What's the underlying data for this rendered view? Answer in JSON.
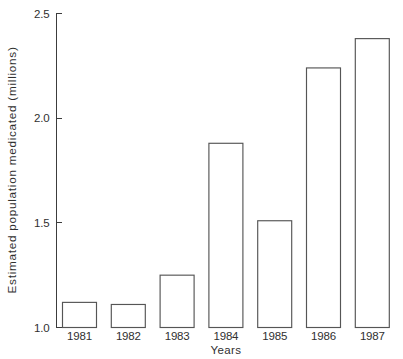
{
  "chart_data": {
    "type": "bar",
    "title": "",
    "xlabel": "Years",
    "ylabel": "Estimated population medicated (millions)",
    "categories": [
      "1981",
      "1982",
      "1983",
      "1984",
      "1985",
      "1986",
      "1987"
    ],
    "values": [
      1.12,
      1.11,
      1.25,
      1.88,
      1.51,
      2.24,
      2.38
    ],
    "series": [
      {
        "name": "Estimated population medicated (millions)",
        "values": [
          1.12,
          1.11,
          1.25,
          1.88,
          1.51,
          2.24,
          2.38
        ]
      }
    ],
    "ylim": [
      1.0,
      2.5
    ],
    "yticks": [
      1.0,
      1.5,
      2.0,
      2.5
    ],
    "ytick_labels": [
      "1.0",
      "1.5",
      "2.0",
      "2.5"
    ],
    "xtick_labels": [
      "1981",
      "1982",
      "1983",
      "1984",
      "1985",
      "1986",
      "1987"
    ],
    "grid": false,
    "legend": false,
    "legend_position": "none",
    "bar_fill": "#ffffff",
    "bar_stroke": "#555555",
    "axis_color": "#3c3c3c",
    "background": "#ffffff"
  },
  "axes": {
    "y_title": "Estimated population medicated (millions)",
    "x_title": "Years"
  },
  "ticks": {
    "y": [
      {
        "label": "2.5",
        "value": 2.5
      },
      {
        "label": "2.0",
        "value": 2.0
      },
      {
        "label": "1.5",
        "value": 1.5
      },
      {
        "label": "1.0",
        "value": 1.0
      }
    ],
    "x": [
      {
        "label": "1981",
        "value": 1.12
      },
      {
        "label": "1982",
        "value": 1.11
      },
      {
        "label": "1983",
        "value": 1.25
      },
      {
        "label": "1984",
        "value": 1.88
      },
      {
        "label": "1985",
        "value": 1.51
      },
      {
        "label": "1986",
        "value": 2.24
      },
      {
        "label": "1987",
        "value": 2.38
      }
    ]
  }
}
